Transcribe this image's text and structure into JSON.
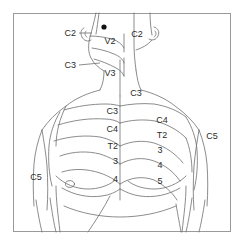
{
  "figure": {
    "type": "anatomical-line-drawing",
    "view": "anterior",
    "background_color": "#ffffff",
    "frame_color": "#9a9a9a",
    "line_color": "#6e6e6e",
    "text_color": "#2b2b2b"
  },
  "markers": [
    {
      "name": "reference-dot",
      "x": 104,
      "y": 27,
      "color": "#111111",
      "radius": 2.6
    }
  ],
  "labels": [
    {
      "id": "c2-left",
      "text": "C2",
      "x": 76,
      "y": 33,
      "align": "right",
      "leader": {
        "x1": 79,
        "y1": 33,
        "x2": 92,
        "y2": 33
      }
    },
    {
      "id": "v2-left",
      "text": "V2",
      "x": 110,
      "y": 41,
      "align": "center",
      "leader": null
    },
    {
      "id": "c3-left",
      "text": "C3",
      "x": 76,
      "y": 65,
      "align": "right",
      "leader": {
        "x1": 79,
        "y1": 65,
        "x2": 100,
        "y2": 63
      }
    },
    {
      "id": "v3-left",
      "text": "V3",
      "x": 110,
      "y": 73,
      "align": "center",
      "leader": null
    },
    {
      "id": "c2-right",
      "text": "C2",
      "x": 137,
      "y": 34,
      "align": "center",
      "leader": null
    },
    {
      "id": "c3-neck",
      "text": "C3",
      "x": 136,
      "y": 93,
      "align": "center",
      "leader": null
    },
    {
      "id": "c3-left-chest",
      "text": "C3",
      "x": 118,
      "y": 111,
      "align": "right",
      "leader": null
    },
    {
      "id": "c4-left-chest",
      "text": "C4",
      "x": 118,
      "y": 129,
      "align": "right",
      "leader": null
    },
    {
      "id": "t2-left-chest",
      "text": "T2",
      "x": 118,
      "y": 146,
      "align": "right",
      "leader": null
    },
    {
      "id": "n3-left-chest",
      "text": "3",
      "x": 118,
      "y": 161,
      "align": "right",
      "leader": null
    },
    {
      "id": "n4-left-chest",
      "text": "4",
      "x": 118,
      "y": 179,
      "align": "right",
      "leader": null
    },
    {
      "id": "c4-right-chest",
      "text": "C4",
      "x": 162,
      "y": 120,
      "align": "center",
      "leader": null
    },
    {
      "id": "t2-right-chest",
      "text": "T2",
      "x": 162,
      "y": 135,
      "align": "center",
      "leader": null
    },
    {
      "id": "n3-right-chest",
      "text": "3",
      "x": 160,
      "y": 150,
      "align": "center",
      "leader": null
    },
    {
      "id": "n4-right-chest",
      "text": "4",
      "x": 160,
      "y": 165,
      "align": "center",
      "leader": null
    },
    {
      "id": "n5-right-chest",
      "text": "5",
      "x": 160,
      "y": 181,
      "align": "center",
      "leader": null
    },
    {
      "id": "c5-right",
      "text": "C5",
      "x": 212,
      "y": 136,
      "align": "center",
      "leader": null
    },
    {
      "id": "c5-left",
      "text": "C5",
      "x": 36,
      "y": 177,
      "align": "center",
      "leader": null
    }
  ]
}
